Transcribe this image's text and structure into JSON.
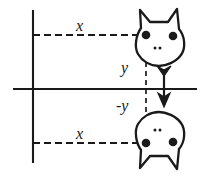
{
  "figure": {
    "name": "cartesian-reflection-diagram",
    "stroke_color": "#1a1a1a",
    "fill_color": "#ffffff",
    "background_color": "#ffffff",
    "width": 207,
    "height": 177
  },
  "axes": {
    "vertical": {
      "name": "y-axis",
      "x": 33,
      "y1": 10,
      "y2": 163
    },
    "horizontal": {
      "name": "x-axis",
      "y": 89,
      "x1": 13,
      "x2": 197
    }
  },
  "labels": {
    "x_top": "x",
    "x_bottom": "x",
    "y": "y",
    "neg_y": "-y"
  },
  "guides": {
    "top_dashed": {
      "name": "horizontal-distance-top",
      "y": 35,
      "x1": 33,
      "x2": 146
    },
    "bottom_dashed": {
      "name": "horizontal-distance-bottom",
      "y": 143,
      "x1": 33,
      "x2": 146
    },
    "vertical_dashed": {
      "name": "vertical-distance",
      "x": 146,
      "y1": 35,
      "y2": 143
    }
  },
  "arrow": {
    "name": "reflection-arrow",
    "x": 164,
    "y_start": 67,
    "y_end": 106,
    "direction": "down"
  },
  "shapes": {
    "top_cat": {
      "name": "cat-face-upright",
      "eyes": [
        {
          "cx": 146,
          "cy": 35
        },
        {
          "cx": 173,
          "cy": 36
        }
      ],
      "nose_dots": [
        {
          "cx": 155,
          "cy": 48
        },
        {
          "cx": 160,
          "cy": 48
        }
      ]
    },
    "bottom_cat": {
      "name": "cat-face-reflected",
      "eyes": [
        {
          "cx": 146,
          "cy": 143
        },
        {
          "cx": 173,
          "cy": 142
        }
      ],
      "nose_dots": [
        {
          "cx": 155,
          "cy": 130
        },
        {
          "cx": 160,
          "cy": 130
        }
      ]
    }
  }
}
